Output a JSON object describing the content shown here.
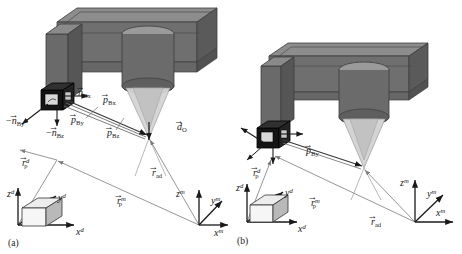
{
  "figure": {
    "background_color": "#ffffff",
    "panels": [
      {
        "id": "a",
        "caption": "(a)",
        "machine": {
          "body_color": "#6f6f6f",
          "body_top_color": "#8d8d8d",
          "body_side_color": "#5a5a5a",
          "spindle_color": "#6b6b6b",
          "spindle_top_color": "#9a9a9a",
          "cone_color": "#cfcfcf",
          "camera_color": "#141414",
          "camera_face_color": "#d8d8d8"
        },
        "labels": [
          {
            "name": "n-bx-vector",
            "base": "n",
            "arrow": true,
            "sign": "",
            "sub": "Bx",
            "sup": "",
            "x": 78,
            "y": 88
          },
          {
            "name": "n-by-vector",
            "base": "n",
            "arrow": true,
            "sign": "−",
            "sub": "By",
            "sup": "",
            "x": 6,
            "y": 116
          },
          {
            "name": "n-bz-vector",
            "base": "n",
            "arrow": true,
            "sign": "−",
            "sub": "Bz",
            "sup": "",
            "x": 46,
            "y": 128
          },
          {
            "name": "p-bx-vector",
            "base": "p",
            "arrow": true,
            "sign": "",
            "sub": "Bx",
            "sup": "",
            "x": 103,
            "y": 95
          },
          {
            "name": "p-by-vector",
            "base": "p",
            "arrow": true,
            "sign": "",
            "sub": "By",
            "sup": "",
            "x": 71,
            "y": 115
          },
          {
            "name": "p-bz-vector",
            "base": "p",
            "arrow": true,
            "sign": "",
            "sub": "Bz",
            "sup": "",
            "x": 107,
            "y": 128
          },
          {
            "name": "d-o-vector",
            "base": "d",
            "arrow": true,
            "sign": "",
            "sub": "O",
            "sup": "",
            "x": 177,
            "y": 122
          },
          {
            "name": "r-ad-vector",
            "base": "r",
            "arrow": true,
            "sign": "",
            "sub": "ad",
            "sup": "",
            "x": 152,
            "y": 168
          },
          {
            "name": "r-p-d-vector",
            "base": "r",
            "arrow": true,
            "sign": "",
            "sub": "p",
            "sup": "d",
            "x": 22,
            "y": 158
          },
          {
            "name": "r-p-m-vector",
            "base": "r",
            "arrow": true,
            "sign": "",
            "sub": "p",
            "sup": "m",
            "x": 117,
            "y": 196
          },
          {
            "name": "axis-zd",
            "base": "z",
            "arrow": false,
            "sign": "",
            "sub": "",
            "sup": "d",
            "x": 7,
            "y": 189
          },
          {
            "name": "axis-yd",
            "base": "y",
            "arrow": false,
            "sign": "",
            "sub": "",
            "sup": "d",
            "x": 58,
            "y": 193
          },
          {
            "name": "axis-xd",
            "base": "x",
            "arrow": false,
            "sign": "",
            "sub": "",
            "sup": "d",
            "x": 76,
            "y": 227
          },
          {
            "name": "axis-zm",
            "base": "z",
            "arrow": false,
            "sign": "",
            "sub": "",
            "sup": "m",
            "x": 176,
            "y": 189
          },
          {
            "name": "axis-ym",
            "base": "y",
            "arrow": false,
            "sign": "",
            "sub": "",
            "sup": "m",
            "x": 211,
            "y": 196
          },
          {
            "name": "axis-xm",
            "base": "x",
            "arrow": false,
            "sign": "",
            "sub": "",
            "sup": "m",
            "x": 214,
            "y": 228
          }
        ]
      },
      {
        "id": "b",
        "caption": "(b)",
        "machine": {
          "body_color": "#6f6f6f",
          "body_top_color": "#8d8d8d",
          "body_side_color": "#5a5a5a",
          "spindle_color": "#6b6b6b",
          "spindle_top_color": "#9a9a9a",
          "cone_color": "#cfcfcf",
          "camera_color": "#141414",
          "camera_face_color": "#d8d8d8"
        },
        "labels": [
          {
            "name": "p-by-vector",
            "base": "p",
            "arrow": true,
            "sign": "",
            "sub": "By",
            "sup": "",
            "x": 75,
            "y": 146
          },
          {
            "name": "r-p-d-vector",
            "base": "r",
            "arrow": true,
            "sign": "",
            "sub": "p",
            "sup": "d",
            "x": 22,
            "y": 168
          },
          {
            "name": "r-p-m-vector",
            "base": "r",
            "arrow": true,
            "sign": "",
            "sub": "p",
            "sup": "m",
            "x": 80,
            "y": 198
          },
          {
            "name": "r-ad-vector",
            "base": "r",
            "arrow": true,
            "sign": "",
            "sub": "ad",
            "sup": "",
            "x": 140,
            "y": 217
          },
          {
            "name": "axis-zd",
            "base": "z",
            "arrow": false,
            "sign": "",
            "sub": "",
            "sup": "d",
            "x": 5,
            "y": 183
          },
          {
            "name": "axis-yd",
            "base": "y",
            "arrow": false,
            "sign": "",
            "sub": "",
            "sup": "d",
            "x": 54,
            "y": 188
          },
          {
            "name": "axis-xd",
            "base": "x",
            "arrow": false,
            "sign": "",
            "sub": "",
            "sup": "d",
            "x": 67,
            "y": 224
          },
          {
            "name": "axis-zm",
            "base": "z",
            "arrow": false,
            "sign": "",
            "sub": "",
            "sup": "m",
            "x": 169,
            "y": 178
          },
          {
            "name": "axis-ym",
            "base": "y",
            "arrow": false,
            "sign": "",
            "sub": "",
            "sup": "m",
            "x": 196,
            "y": 189
          },
          {
            "name": "axis-xm",
            "base": "x",
            "arrow": false,
            "sign": "",
            "sub": "",
            "sup": "m",
            "x": 205,
            "y": 208
          }
        ]
      }
    ]
  }
}
